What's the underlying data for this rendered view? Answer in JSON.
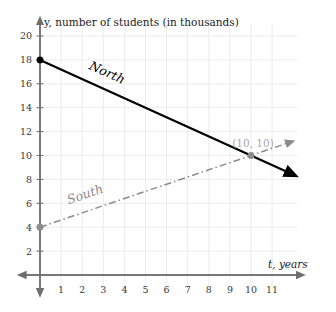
{
  "chart_data": {
    "type": "line",
    "title": "",
    "xlabel": "t, years",
    "ylabel": "y, number of students (in thousands)",
    "xlim": [
      -0.7,
      12.2
    ],
    "ylim": [
      -1.2,
      21.0
    ],
    "grid": true,
    "legend_position": "inline-along-lines",
    "x_ticks": [
      "1",
      "2",
      "3",
      "4",
      "5",
      "6",
      "7",
      "8",
      "9",
      "10",
      "11"
    ],
    "x_tick_values": [
      1,
      2,
      3,
      4,
      5,
      6,
      7,
      8,
      9,
      10,
      11
    ],
    "y_ticks": [
      "2",
      "4",
      "6",
      "8",
      "10",
      "12",
      "14",
      "16",
      "18",
      "20"
    ],
    "y_tick_values": [
      2,
      4,
      6,
      8,
      10,
      12,
      14,
      16,
      18,
      20
    ],
    "series": [
      {
        "name": "North",
        "style": "solid",
        "color": "#000000",
        "start_point": {
          "x": 0,
          "y": 18
        },
        "end_point": {
          "x": 11.7,
          "y": 8.64
        },
        "slope": -0.8,
        "intercept": 18,
        "values": [
          {
            "x": 0,
            "y": 18
          },
          {
            "x": 1,
            "y": 17.2
          },
          {
            "x": 2,
            "y": 16.4
          },
          {
            "x": 3,
            "y": 15.6
          },
          {
            "x": 4,
            "y": 14.8
          },
          {
            "x": 5,
            "y": 14
          },
          {
            "x": 6,
            "y": 13.2
          },
          {
            "x": 7,
            "y": 12.4
          },
          {
            "x": 8,
            "y": 11.6
          },
          {
            "x": 9,
            "y": 10.8
          },
          {
            "x": 10,
            "y": 10
          },
          {
            "x": 11,
            "y": 9.2
          }
        ]
      },
      {
        "name": "South",
        "style": "dash-dot",
        "color": "#8c8c8c",
        "start_point": {
          "x": 0,
          "y": 4
        },
        "end_point": {
          "x": 11.7,
          "y": 11.02
        },
        "slope": 0.6,
        "intercept": 4,
        "values": [
          {
            "x": 0,
            "y": 4
          },
          {
            "x": 1,
            "y": 4.6
          },
          {
            "x": 2,
            "y": 5.2
          },
          {
            "x": 3,
            "y": 5.8
          },
          {
            "x": 4,
            "y": 6.4
          },
          {
            "x": 5,
            "y": 7
          },
          {
            "x": 6,
            "y": 7.6
          },
          {
            "x": 7,
            "y": 8.2
          },
          {
            "x": 8,
            "y": 8.8
          },
          {
            "x": 9,
            "y": 9.4
          },
          {
            "x": 10,
            "y": 10
          },
          {
            "x": 11,
            "y": 10.6
          }
        ]
      }
    ],
    "annotations": [
      {
        "label": "(10, 10)",
        "x": 10,
        "y": 10,
        "describes": "intersection of North and South"
      }
    ],
    "markers": [
      {
        "series": "North",
        "x": 0,
        "y": 18,
        "color": "#000000"
      },
      {
        "series": "South",
        "x": 0,
        "y": 4,
        "color": "#8c8c8c"
      },
      {
        "series": "intersection",
        "x": 10,
        "y": 10,
        "color": "#8c8c8c"
      }
    ],
    "colors": {
      "north": "#000000",
      "south": "#8c8c8c",
      "axis": "#6e6e6e",
      "grid": "#ececec",
      "tick_text": "#3a3a3a",
      "annotation": "#a8a8a8",
      "background": "#ffffff"
    }
  }
}
